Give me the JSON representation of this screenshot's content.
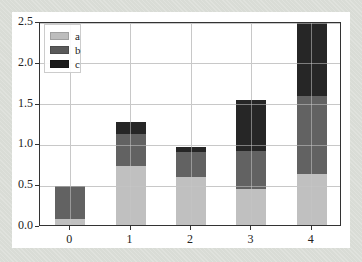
{
  "chart_data": {
    "type": "bar",
    "stacked": true,
    "title": "",
    "xlabel": "",
    "ylabel": "",
    "categories": [
      "0",
      "1",
      "2",
      "3",
      "4"
    ],
    "x": [
      0,
      1,
      2,
      3,
      4
    ],
    "series": [
      {
        "name": "a",
        "color": "#bdbdbd",
        "values": [
          0.1,
          0.75,
          0.61,
          0.47,
          0.65
        ]
      },
      {
        "name": "b",
        "color": "#5a5a5a",
        "values": [
          0.4,
          0.39,
          0.31,
          0.46,
          0.96
        ]
      },
      {
        "name": "c",
        "color": "#1a1a1a",
        "values": [
          0.0,
          0.15,
          0.06,
          0.63,
          0.92
        ]
      }
    ],
    "xlim": [
      -0.5,
      4.5
    ],
    "ylim": [
      0.0,
      2.5
    ],
    "yticks": [
      "0.0",
      "0.5",
      "1.0",
      "1.5",
      "2.0",
      "2.5"
    ],
    "xticks": [
      "0",
      "1",
      "2",
      "3",
      "4"
    ],
    "grid": true,
    "legend_position": "upper left",
    "bar_width": 0.5
  }
}
